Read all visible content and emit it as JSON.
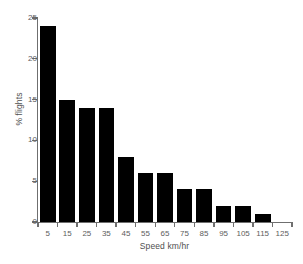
{
  "chart_data": {
    "type": "bar",
    "title": "",
    "subtitle": "",
    "xlabel": "Speed km/hr",
    "ylabel": "% flights",
    "categories": [
      "5",
      "15",
      "25",
      "35",
      "45",
      "55",
      "65",
      "75",
      "85",
      "95",
      "105",
      "115",
      "125"
    ],
    "values": [
      24,
      15,
      14,
      14,
      8,
      6,
      6,
      4,
      4,
      2,
      2,
      1,
      0
    ],
    "ylim": [
      0,
      25
    ],
    "yticks": [
      0,
      5,
      10,
      15,
      20,
      25
    ],
    "ytick_labels": [
      "0",
      "5",
      "10",
      "15",
      "20",
      "25"
    ],
    "xtick_labels": [
      "5",
      "15",
      "25",
      "35",
      "45",
      "55",
      "65",
      "75",
      "85",
      "95",
      "105",
      "115",
      "125"
    ],
    "grid": false,
    "legend": false,
    "legend_position": "none",
    "bar_color": "#000000",
    "axis_color": "#6f6f6f",
    "text_color": "#5d5d5d",
    "background_color": "#ffffff",
    "annotations": []
  }
}
